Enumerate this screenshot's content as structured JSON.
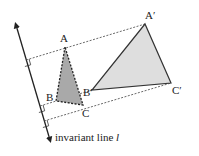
{
  "figure": {
    "colors": {
      "line": "#222222",
      "dashed": "#444444",
      "small_triangle_fill": "#a9a9a9",
      "large_triangle_fill": "#dedede",
      "large_triangle_stroke": "#333333"
    }
  },
  "points": {
    "A": {
      "label": "A",
      "x": 65,
      "y": 47
    },
    "B": {
      "label": "B",
      "x": 56,
      "y": 101
    },
    "C": {
      "label": "C",
      "x": 83,
      "y": 105
    },
    "A_prime": {
      "label": "A′",
      "x": 145,
      "y": 24
    },
    "B_prime": {
      "label": "B′",
      "x": 92,
      "y": 90
    },
    "C_prime": {
      "label": "C′",
      "x": 171,
      "y": 83
    }
  },
  "invariant_line": {
    "label_text": "invariant line ",
    "label_var": "l"
  }
}
